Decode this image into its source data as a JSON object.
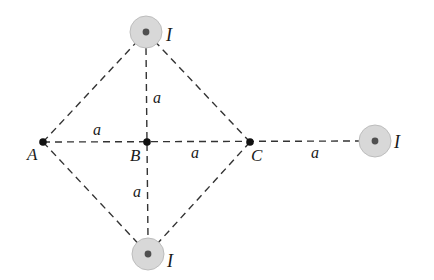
{
  "diagram": {
    "type": "physics-magnetic-field",
    "colors": {
      "line": "#333333",
      "point": "#111111",
      "wire_fill": "#d8d8d8",
      "wire_ring": "#bdbdbd",
      "wire_dot": "#505050",
      "text": "#1a1a1a"
    },
    "points": [
      {
        "id": "A",
        "label": "A",
        "x": 43,
        "y": 142
      },
      {
        "id": "B",
        "label": "B",
        "x": 147,
        "y": 142
      },
      {
        "id": "C",
        "label": "C",
        "x": 250,
        "y": 142
      }
    ],
    "wires": [
      {
        "id": "top",
        "label": "I",
        "x": 146,
        "y": 32,
        "direction": "out-of-page"
      },
      {
        "id": "bottom",
        "label": "I",
        "x": 148,
        "y": 254,
        "direction": "out-of-page"
      },
      {
        "id": "right",
        "label": "I",
        "x": 375,
        "y": 141,
        "direction": "out-of-page"
      }
    ],
    "segments": [
      {
        "from": "A",
        "to": "top"
      },
      {
        "from": "A",
        "to": "bottom"
      },
      {
        "from": "C",
        "to": "top"
      },
      {
        "from": "C",
        "to": "bottom"
      },
      {
        "from": "top",
        "to": "bottom"
      },
      {
        "from": "A",
        "to": "right"
      }
    ],
    "distance_labels": [
      {
        "text": "a",
        "between": "A-B"
      },
      {
        "text": "a",
        "between": "B-C"
      },
      {
        "text": "a",
        "between": "C-right wire"
      },
      {
        "text": "a",
        "between": "B-top wire"
      },
      {
        "text": "a",
        "between": "B-bottom wire"
      }
    ],
    "labels": {
      "A": "A",
      "B": "B",
      "C": "C",
      "current": "I",
      "distance": "a"
    }
  }
}
